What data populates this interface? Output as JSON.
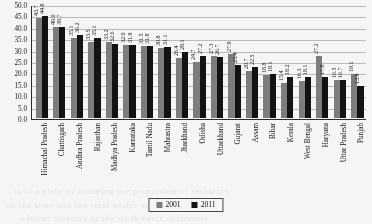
{
  "chart_data": {
    "type": "bar",
    "title": "",
    "xlabel": "",
    "ylabel": "",
    "ylim": [
      0.0,
      50.0
    ],
    "ytick_step": 5.0,
    "grid": true,
    "legend_position": "bottom-center",
    "categories": [
      "Himachal Pradesh",
      "Chattisgarh",
      "Andhra Pradesh",
      "Rajasthan",
      "Madhya Pradesh",
      "Karnataka",
      "Tamil Nadu",
      "Mahrastra",
      "Jharkhand",
      "Odisha",
      "Uttarkhand",
      "Gujarat",
      "Assam",
      "Bihar",
      "Kerala",
      "West Bengal",
      "Haryana",
      "Uttar Pradesh",
      "Punjab"
    ],
    "yticks": [
      "0.0",
      "5.0",
      "10.0",
      "15.0",
      "20.0",
      "25.0",
      "30.0",
      "35.0",
      "40.0",
      "45.0",
      "50.0"
    ],
    "series": [
      {
        "name": "2001",
        "color": "#7d7d7d",
        "values": [
          43.7,
          40.0,
          35.1,
          33.5,
          33.2,
          32.0,
          31.5,
          30.8,
          26.4,
          24.7,
          27.3,
          27.9,
          20.7,
          18.8,
          15.4,
          16.3,
          27.2,
          16.5,
          19.1
        ]
      },
      {
        "name": "2011",
        "color": "#151515",
        "values": [
          44.8,
          39.7,
          36.2,
          35.1,
          32.6,
          31.9,
          31.8,
          31.1,
          29.1,
          27.2,
          26.7,
          23.4,
          22.5,
          19.1,
          18.2,
          18.1,
          17.8,
          16.7,
          13.9
        ]
      }
    ],
    "data_labels": {
      "2001": [
        "43.7",
        "40.0",
        "35.1",
        "33.5",
        "33.2",
        "32.0",
        "31.5",
        "30.8",
        "26.4",
        "24.7",
        "27.3",
        "27.9",
        "20.7",
        "18.8",
        "15.4",
        "16.3",
        "27.2",
        "16.5",
        "19.1"
      ],
      "2011": [
        "44.8",
        "39.7",
        "36.2",
        "35.1",
        "32.6",
        "31.9",
        "31.8",
        "31.1",
        "29.1",
        "27.2",
        "26.7",
        "23.4",
        "22.5",
        "19.1",
        "18.2",
        "18.1",
        "17.8",
        "16.7",
        "13.9"
      ]
    }
  },
  "legend": {
    "items": [
      {
        "label": "2001",
        "color": "#7d7d7d"
      },
      {
        "label": "2011",
        "color": "#151515"
      }
    ]
  },
  "page_bleed": {
    "line1": "is of  a  state  by  studying  the  proportion  of  residents",
    "line2": "on  the  state  and  the  rural  sector  and  the",
    "line3": "a  broad  measure  of  the  work-force  indicators"
  }
}
